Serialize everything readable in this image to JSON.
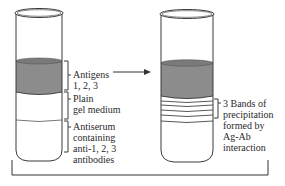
{
  "diagram": {
    "left_tube": {
      "labels": {
        "antigens": [
          "Antigens",
          "1, 2, 3"
        ],
        "plain_gel": [
          "Plain",
          "gel medium"
        ],
        "antiserum": [
          "Antiserum",
          "containing",
          "anti-1, 2, 3",
          "antibodies"
        ]
      }
    },
    "right_tube": {
      "labels": {
        "bands": [
          "3 Bands of",
          "precipitation",
          "formed by",
          "Ag-Ab",
          "interaction"
        ]
      },
      "band_count": 3
    },
    "colors": {
      "outline": "#3a3a3a",
      "antigen_fill": "#8c8c8c",
      "background": "#ffffff"
    }
  }
}
